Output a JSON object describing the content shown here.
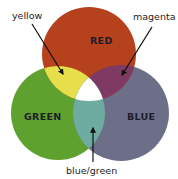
{
  "diagram": {
    "type": "additive-color-venn",
    "circles": [
      {
        "id": "red",
        "label": "RED",
        "color": "#b5421c"
      },
      {
        "id": "green",
        "label": "GREEN",
        "color": "#5fa12e"
      },
      {
        "id": "blue",
        "label": "BLUE",
        "color": "#6c6f87"
      }
    ],
    "overlaps": [
      {
        "id": "red-green",
        "label": "yellow",
        "color": "#e6de4a"
      },
      {
        "id": "red-blue",
        "label": "magenta",
        "color": "#7e3a62"
      },
      {
        "id": "green-blue",
        "label": "blue/green",
        "color": "#6eaba0"
      },
      {
        "id": "all",
        "label": "white",
        "color": "#ffffff"
      }
    ],
    "callouts": {
      "yellow": "yellow",
      "magenta": "magenta",
      "blue_green": "blue/green"
    }
  }
}
